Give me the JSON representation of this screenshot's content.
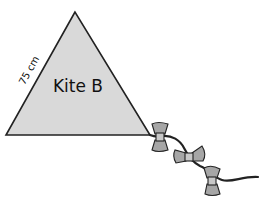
{
  "diagram": {
    "kite_name": "Kite B",
    "side_length_label": "75 cm",
    "shape": "equilateral-triangle",
    "fill_color": "#d9d9d9",
    "stroke_color": "#222222",
    "bow_fill_color": "#a6a6a6",
    "tail_bows_count": 3
  }
}
